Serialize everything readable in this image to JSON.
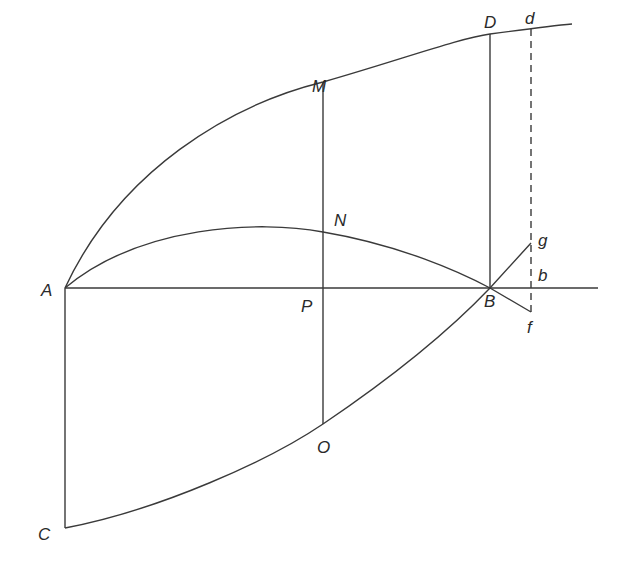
{
  "diagram": {
    "type": "geometric-construction",
    "labels": {
      "A": "A",
      "B": "B",
      "C": "C",
      "D": "D",
      "M": "M",
      "N": "N",
      "O": "O",
      "P": "P",
      "d": "d",
      "g": "g",
      "b": "b",
      "f": "f"
    },
    "points": {
      "A": [
        65,
        288
      ],
      "B": [
        490,
        288
      ],
      "C": [
        65,
        528
      ],
      "D": [
        490,
        34
      ],
      "M": [
        323,
        82
      ],
      "N": [
        323,
        232
      ],
      "O": [
        323,
        424
      ],
      "P": [
        323,
        288
      ],
      "d": [
        531,
        29
      ],
      "g": [
        531,
        243
      ],
      "b": [
        531,
        288
      ],
      "f": [
        531,
        312
      ]
    },
    "colors": {
      "stroke": "#3a3a3a",
      "text": "#2a2a2a",
      "background": "#ffffff"
    }
  }
}
